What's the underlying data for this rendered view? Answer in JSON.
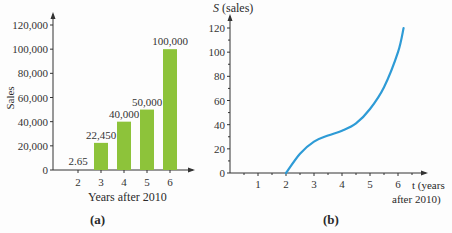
{
  "chart_data": [
    {
      "type": "bar",
      "caption": "(a)",
      "categories": [
        "2",
        "3",
        "4",
        "5",
        "6"
      ],
      "values": [
        2.65,
        22450,
        40000,
        50000,
        100000
      ],
      "data_labels": [
        "2.65",
        "22,450",
        "40,000",
        "50,000",
        "100,000"
      ],
      "xlabel": "Years after 2010",
      "ylabel": "Sales",
      "ylim": [
        0,
        120000
      ],
      "yticks": [
        "0",
        "20,000",
        "40,000",
        "60,000",
        "80,000",
        "100,000",
        "120,000"
      ],
      "bar_color": "#8dc33a",
      "grid": false
    },
    {
      "type": "line",
      "caption": "(b)",
      "ylabel": "S (sales)",
      "xlabel": "t (years after 2010)",
      "xticks": [
        "1",
        "2",
        "3",
        "4",
        "5",
        "6"
      ],
      "yticks": [
        "0",
        "20",
        "40",
        "60",
        "80",
        "100",
        "120"
      ],
      "ylim": [
        0,
        120
      ],
      "xlim": [
        0,
        7
      ],
      "series": [
        {
          "name": "S(t)",
          "x": [
            2,
            2.5,
            3,
            3.5,
            4,
            4.5,
            5,
            5.5,
            6,
            6.2
          ],
          "values": [
            0,
            16,
            26,
            31,
            35,
            41,
            53,
            71,
            100,
            120
          ]
        }
      ],
      "line_color": "#2e9bd6",
      "grid": false
    }
  ],
  "labels": {
    "a_caption": "(a)",
    "b_caption": "(b)",
    "a_xlabel": "Years after 2010",
    "a_ylabel": "Sales",
    "b_ylabel_var": "S",
    "b_ylabel_rest": " (sales)",
    "b_xlabel_line1": "t (years",
    "b_xlabel_line2": "after 2010)"
  }
}
